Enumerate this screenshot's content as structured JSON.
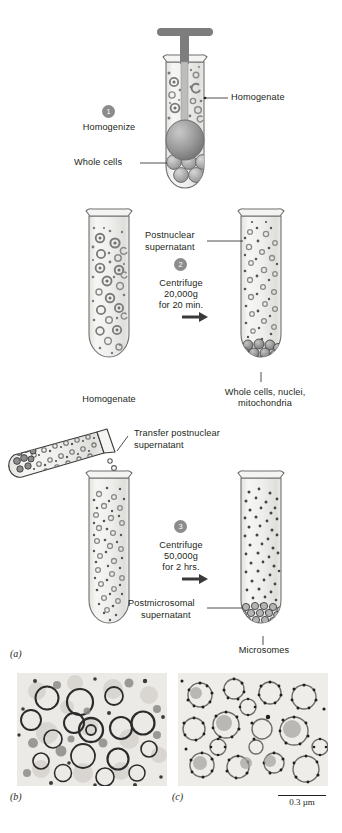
{
  "figure": {
    "panels": [
      {
        "id": "a",
        "label": "(a)"
      },
      {
        "id": "b",
        "label": "(b)"
      },
      {
        "id": "c",
        "label": "(c)"
      }
    ],
    "scale_bar": {
      "label": "0.3 µm"
    }
  },
  "steps": [
    {
      "number": "1",
      "action": "Homogenize",
      "lines": [
        "Homogenize"
      ]
    },
    {
      "number": "2",
      "action": "Centrifuge",
      "lines": [
        "Centrifuge",
        "20,000g",
        "for 20 min."
      ]
    },
    {
      "number": "3",
      "action": "Centrifuge",
      "lines": [
        "Centrifuge",
        "50,000g",
        "for 2 hrs."
      ]
    }
  ],
  "labels": {
    "homogenate_callout": "Homogenate",
    "whole_cells": "Whole cells",
    "homogenate_tube": "Homogenate",
    "postnuclear_supernatant_l1": "Postnuclear",
    "postnuclear_supernatant_l2": "supernatant",
    "pellet_l1": "Whole cells, nuclei,",
    "pellet_l2": "mitochondria",
    "transfer_l1": "Transfer postnuclear",
    "transfer_l2": "supernatant",
    "postmicrosomal_l1": "Postmicrosomal",
    "postmicrosomal_l2": "supernatant",
    "microsomes": "Microsomes"
  },
  "colors": {
    "ink": "#231f20",
    "tube_stroke": "#6f6f6f",
    "tube_fill": "#eeeeec",
    "pestle": "#808080",
    "organelle": "#9a9a9a",
    "badge": "#8c8c8c",
    "micrograph_bg": "#e9e9e7"
  }
}
